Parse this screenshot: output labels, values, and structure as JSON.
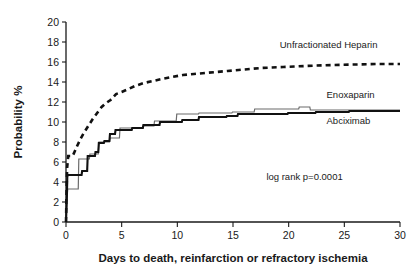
{
  "chart_data": {
    "type": "line",
    "title": "",
    "subtitle": "",
    "xlabel": "Days to death, reinfarction or refractory ischemia",
    "ylabel": "Probability %",
    "xlim": [
      0,
      30
    ],
    "ylim": [
      0,
      20
    ],
    "xticks": [
      "0",
      "5",
      "10",
      "15",
      "20",
      "25",
      "30"
    ],
    "yticks": [
      "0",
      "2",
      "4",
      "6",
      "8",
      "10",
      "12",
      "14",
      "16",
      "18",
      "20"
    ],
    "grid": false,
    "legend_position": "inline-right",
    "annotations": [
      {
        "name": "log-rank",
        "text": "log rank p=0.0001",
        "x": 18.0,
        "y": 4.2
      }
    ],
    "series": [
      {
        "name": "Unfractionated Heparin",
        "style": "dashed",
        "color": "#111111",
        "label_x": 19.2,
        "label_y": 17.4,
        "points": [
          [
            0.0,
            0.0
          ],
          [
            0.05,
            3.0
          ],
          [
            0.1,
            5.4
          ],
          [
            0.2,
            6.6
          ],
          [
            0.6,
            6.6
          ],
          [
            0.8,
            7.1
          ],
          [
            1.0,
            7.6
          ],
          [
            1.3,
            8.3
          ],
          [
            1.6,
            8.9
          ],
          [
            2.0,
            9.6
          ],
          [
            2.4,
            10.3
          ],
          [
            2.8,
            10.9
          ],
          [
            3.2,
            11.5
          ],
          [
            3.6,
            11.9
          ],
          [
            4.0,
            12.2
          ],
          [
            4.5,
            12.8
          ],
          [
            5.0,
            13.0
          ],
          [
            5.6,
            13.3
          ],
          [
            6.2,
            13.6
          ],
          [
            7.0,
            13.9
          ],
          [
            7.8,
            14.1
          ],
          [
            8.6,
            14.3
          ],
          [
            9.5,
            14.5
          ],
          [
            10.5,
            14.7
          ],
          [
            11.5,
            14.8
          ],
          [
            12.5,
            14.9
          ],
          [
            13.5,
            15.0
          ],
          [
            14.5,
            15.1
          ],
          [
            15.5,
            15.2
          ],
          [
            16.5,
            15.3
          ],
          [
            17.5,
            15.4
          ],
          [
            18.5,
            15.45
          ],
          [
            19.5,
            15.5
          ],
          [
            20.5,
            15.55
          ],
          [
            21.5,
            15.6
          ],
          [
            22.5,
            15.65
          ],
          [
            24.0,
            15.7
          ],
          [
            26.0,
            15.75
          ],
          [
            28.0,
            15.8
          ],
          [
            30.0,
            15.8
          ]
        ]
      },
      {
        "name": "Enoxaparin",
        "style": "step-thin",
        "color": "#6b6b6b",
        "label_x": 23.4,
        "label_y": 12.4,
        "points": [
          [
            0.0,
            0.0
          ],
          [
            0.1,
            2.3
          ],
          [
            0.15,
            3.3
          ],
          [
            1.1,
            3.3
          ],
          [
            1.15,
            6.3
          ],
          [
            2.1,
            6.3
          ],
          [
            2.15,
            6.8
          ],
          [
            2.9,
            6.8
          ],
          [
            2.95,
            8.0
          ],
          [
            3.9,
            8.0
          ],
          [
            3.95,
            8.4
          ],
          [
            4.8,
            8.4
          ],
          [
            4.85,
            9.4
          ],
          [
            6.9,
            9.4
          ],
          [
            6.95,
            9.6
          ],
          [
            7.9,
            9.6
          ],
          [
            7.95,
            10.1
          ],
          [
            9.9,
            10.1
          ],
          [
            9.95,
            10.8
          ],
          [
            11.9,
            10.8
          ],
          [
            11.95,
            10.9
          ],
          [
            14.9,
            10.9
          ],
          [
            14.95,
            11.0
          ],
          [
            16.9,
            11.0
          ],
          [
            16.95,
            11.3
          ],
          [
            20.9,
            11.3
          ],
          [
            20.95,
            11.5
          ],
          [
            21.9,
            11.5
          ],
          [
            21.95,
            11.2
          ],
          [
            25.0,
            11.2
          ],
          [
            30.0,
            11.2
          ]
        ]
      },
      {
        "name": "Abciximab",
        "style": "step-thick",
        "color": "#111111",
        "label_x": 23.4,
        "label_y": 9.8,
        "points": [
          [
            0.0,
            0.0
          ],
          [
            0.08,
            2.6
          ],
          [
            0.12,
            4.7
          ],
          [
            1.4,
            4.7
          ],
          [
            1.45,
            5.1
          ],
          [
            1.9,
            5.1
          ],
          [
            1.95,
            6.6
          ],
          [
            2.6,
            6.6
          ],
          [
            2.65,
            7.0
          ],
          [
            2.9,
            7.0
          ],
          [
            2.95,
            7.9
          ],
          [
            3.4,
            7.9
          ],
          [
            3.45,
            8.1
          ],
          [
            3.9,
            8.1
          ],
          [
            3.95,
            8.8
          ],
          [
            4.4,
            8.8
          ],
          [
            4.45,
            9.2
          ],
          [
            5.9,
            9.2
          ],
          [
            5.95,
            9.4
          ],
          [
            6.9,
            9.4
          ],
          [
            6.95,
            9.7
          ],
          [
            8.4,
            9.7
          ],
          [
            8.45,
            10.0
          ],
          [
            10.4,
            10.0
          ],
          [
            10.45,
            10.2
          ],
          [
            11.9,
            10.2
          ],
          [
            11.95,
            10.5
          ],
          [
            14.4,
            10.5
          ],
          [
            14.45,
            10.6
          ],
          [
            15.4,
            10.6
          ],
          [
            15.45,
            10.8
          ],
          [
            19.9,
            10.8
          ],
          [
            19.95,
            10.9
          ],
          [
            22.4,
            10.9
          ],
          [
            22.45,
            11.0
          ],
          [
            25.4,
            11.0
          ],
          [
            25.45,
            11.1
          ],
          [
            30.0,
            11.1
          ]
        ]
      }
    ]
  }
}
